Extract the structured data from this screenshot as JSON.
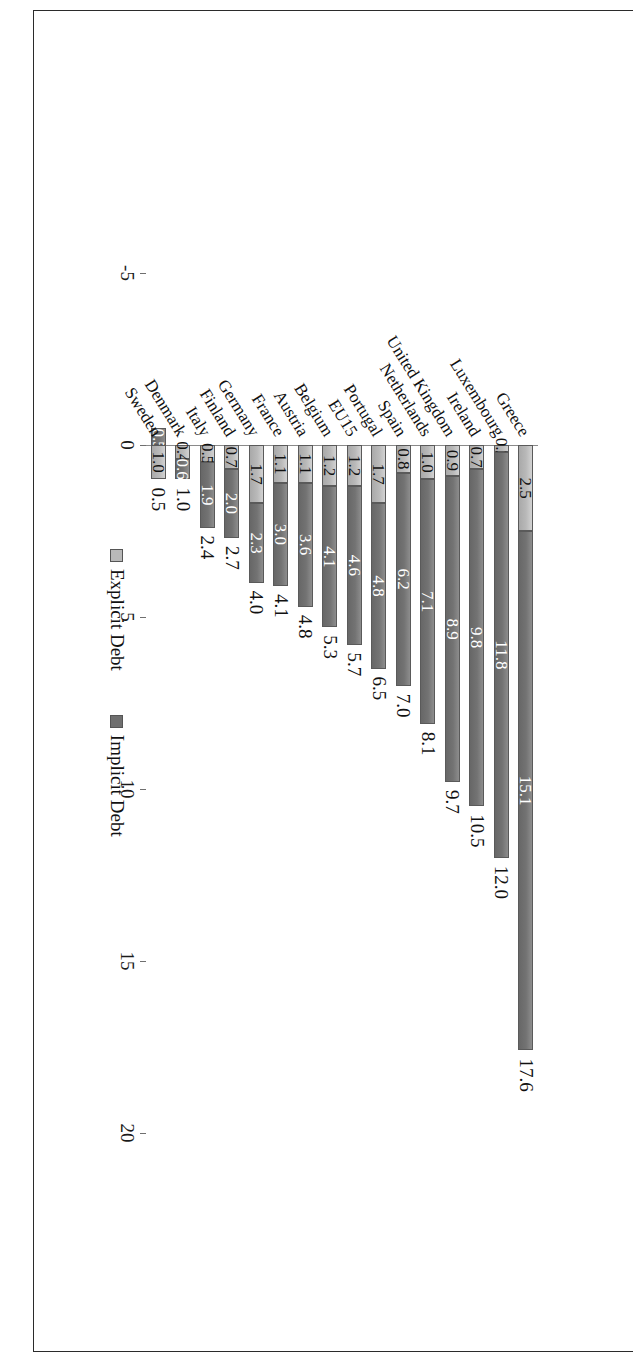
{
  "chart_data": {
    "type": "bar",
    "orientation": "horizontal-stacked",
    "title": "",
    "xlabel": "",
    "ylabel": "",
    "xlim": [
      -5,
      20
    ],
    "xticks": [
      "-5",
      "0",
      "5",
      "10",
      "15",
      "20"
    ],
    "grid": false,
    "legend_position": "bottom-center",
    "categories": [
      "Greece",
      "Luxembourg",
      "Ireland",
      "United Kingdom",
      "Netherlands",
      "Spain",
      "Portugal",
      "EU15",
      "Belgium",
      "Austria",
      "France",
      "Germany",
      "Finland",
      "Italy",
      "Denmark",
      "Sweden"
    ],
    "series": [
      {
        "name": "Explicit Debt",
        "color": "#b9b9b9",
        "values": [
          2.5,
          0.2,
          0.7,
          0.9,
          1.0,
          0.8,
          1.7,
          1.2,
          1.2,
          1.1,
          1.1,
          1.7,
          0.7,
          0.5,
          0.4,
          1.0
        ]
      },
      {
        "name": "Implicit Debt",
        "color": "#6f6f6f",
        "values": [
          15.1,
          11.8,
          9.8,
          8.9,
          7.1,
          6.2,
          4.8,
          4.6,
          4.1,
          3.6,
          3.0,
          2.3,
          2.0,
          1.9,
          0.6,
          -0.5
        ]
      }
    ],
    "totals": [
      17.6,
      12.0,
      10.5,
      9.7,
      8.1,
      7.0,
      6.5,
      5.7,
      5.3,
      4.8,
      4.1,
      4.0,
      2.7,
      2.4,
      1.0,
      0.5
    ],
    "segment_labels": {
      "explicit": [
        "2.5",
        "0.2",
        "0.7",
        "0.9",
        "1.0",
        "0.8",
        "1.7",
        "1.2",
        "1.2",
        "1.1",
        "1.1",
        "1.7",
        "0.7",
        "0.5",
        "0.4",
        "1.0"
      ],
      "implicit": [
        "15.1",
        "11.8",
        "9.8",
        "8.9",
        "7.1",
        "6.2",
        "4.8",
        "4.6",
        "4.1",
        "3.6",
        "3.0",
        "2.3",
        "2.0",
        "1.9",
        "0.6",
        "-0.5"
      ]
    },
    "total_labels": [
      "17.6",
      "12.0",
      "10.5",
      "9.7",
      "8.1",
      "7.0",
      "6.5",
      "5.7",
      "5.3",
      "4.8",
      "4.1",
      "4.0",
      "2.7",
      "2.4",
      "1.0",
      "0.5"
    ]
  },
  "legend": {
    "items": [
      {
        "label": "Explicit Debt",
        "swatch": "explicit"
      },
      {
        "label": "Implicit Debt",
        "swatch": "implicit"
      }
    ]
  }
}
